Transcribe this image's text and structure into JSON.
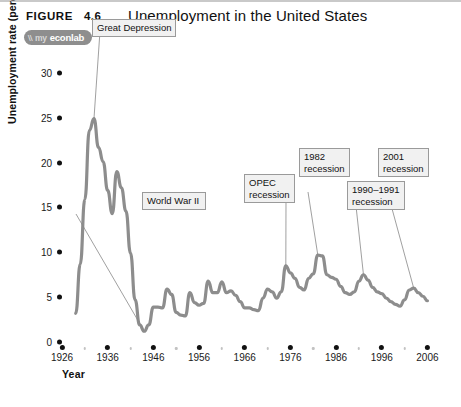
{
  "header": {
    "figure_label": "FIGURE",
    "figure_number": "4.6",
    "title": "Unemployment in the United States"
  },
  "badge": {
    "mark": "\\\\",
    "prefix": "my",
    "word": "econlab"
  },
  "chart_data": {
    "type": "line",
    "title": "Unemployment in the United States",
    "xlabel": "Year",
    "ylabel": "Unemployment rate (percentage of labor force)",
    "xlim": [
      1926,
      2007
    ],
    "ylim": [
      0,
      31
    ],
    "yticks": [
      0,
      5,
      10,
      15,
      20,
      25,
      30
    ],
    "xticks": [
      1926,
      1936,
      1946,
      1956,
      1966,
      1976,
      1986,
      1996,
      2006
    ],
    "xminor": [
      1931,
      1941,
      1951,
      1961,
      1971,
      1981,
      1991,
      2001
    ],
    "grid": false,
    "legend": "none",
    "line_color": "#8d8d8d",
    "series": [
      {
        "name": "Unemployment rate",
        "x": [
          1929,
          1930,
          1931,
          1932,
          1933,
          1934,
          1935,
          1936,
          1937,
          1938,
          1939,
          1940,
          1941,
          1942,
          1943,
          1944,
          1945,
          1946,
          1947,
          1948,
          1949,
          1950,
          1951,
          1952,
          1953,
          1954,
          1955,
          1956,
          1957,
          1958,
          1959,
          1960,
          1961,
          1962,
          1963,
          1964,
          1965,
          1966,
          1967,
          1968,
          1969,
          1970,
          1971,
          1972,
          1973,
          1974,
          1975,
          1976,
          1977,
          1978,
          1979,
          1980,
          1981,
          1982,
          1983,
          1984,
          1985,
          1986,
          1987,
          1988,
          1989,
          1990,
          1991,
          1992,
          1993,
          1994,
          1995,
          1996,
          1997,
          1998,
          1999,
          2000,
          2001,
          2002,
          2003,
          2004,
          2005,
          2006
        ],
        "y": [
          3.2,
          8.7,
          15.9,
          23.6,
          24.9,
          21.7,
          20.1,
          16.9,
          14.3,
          19.0,
          17.2,
          14.6,
          9.9,
          4.7,
          1.9,
          1.2,
          1.9,
          3.9,
          3.9,
          3.8,
          5.9,
          5.3,
          3.3,
          3.0,
          2.9,
          5.5,
          4.4,
          4.1,
          4.3,
          6.8,
          5.5,
          5.5,
          6.7,
          5.5,
          5.7,
          5.2,
          4.5,
          3.8,
          3.8,
          3.6,
          3.5,
          4.9,
          5.9,
          5.6,
          4.9,
          5.6,
          8.5,
          7.7,
          7.1,
          6.1,
          5.8,
          7.1,
          7.6,
          9.7,
          9.6,
          7.5,
          7.2,
          7.0,
          6.2,
          5.5,
          5.3,
          5.6,
          6.8,
          7.5,
          6.9,
          6.1,
          5.6,
          5.4,
          4.9,
          4.5,
          4.2,
          4.0,
          4.7,
          5.8,
          6.0,
          5.5,
          5.1,
          4.6
        ]
      }
    ],
    "annotations": [
      {
        "id": "great-depression",
        "text": "Great Depression",
        "target_x": 1933,
        "target_y": 24.9
      },
      {
        "id": "world-war-ii",
        "text": "World War II",
        "target_x": 1944,
        "target_y": 1.2
      },
      {
        "id": "opec-recession",
        "line1": "OPEC",
        "line2": "recession",
        "target_x": 1975,
        "target_y": 8.5
      },
      {
        "id": "recession-1982",
        "line1": "1982",
        "line2": "recession",
        "target_x": 1982,
        "target_y": 9.7
      },
      {
        "id": "recession-1990-1991",
        "line1": "1990–1991",
        "line2": "recession",
        "target_x": 1992,
        "target_y": 7.5
      },
      {
        "id": "recession-2001",
        "line1": "2001",
        "line2": "recession",
        "target_x": 2003,
        "target_y": 6.0
      }
    ]
  }
}
